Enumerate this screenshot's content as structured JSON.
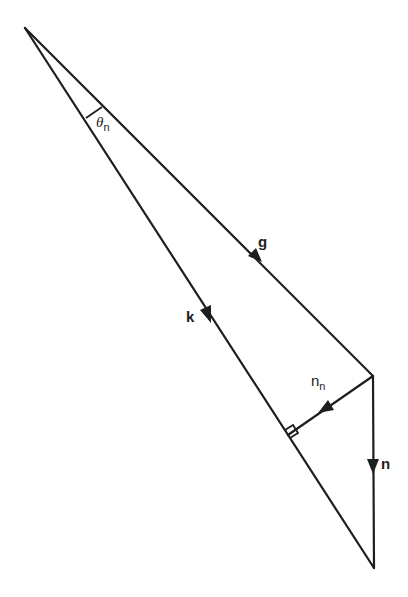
{
  "diagram": {
    "type": "vector-triangle",
    "points": {
      "apex": [
        25,
        28
      ],
      "right_corner": [
        373,
        376
      ],
      "bottom": [
        374,
        568
      ],
      "perpendicular_foot": [
        288,
        435
      ]
    },
    "vectors": [
      {
        "id": "g",
        "label": "g",
        "from": "apex",
        "to": "right_corner",
        "style": "bold"
      },
      {
        "id": "k",
        "label": "k",
        "from": "apex",
        "to": "bottom",
        "style": "bold"
      },
      {
        "id": "n",
        "label": "n",
        "from": "right_corner",
        "to": "bottom",
        "style": "bold"
      },
      {
        "id": "n_n",
        "label": "n",
        "subscript": "n",
        "from": "right_corner",
        "to": "perpendicular_foot",
        "style": "regular"
      }
    ],
    "angle": {
      "label": "θ",
      "subscript": "n",
      "at": "apex",
      "between": [
        "g",
        "k"
      ]
    },
    "right_angle_marker": {
      "at": "perpendicular_foot"
    },
    "colors": {
      "stroke": "#1e1e1e",
      "background": "#ffffff"
    }
  },
  "labels": {
    "g": "g",
    "k": "k",
    "n": "n",
    "n_n_main": "n",
    "n_n_sub": "n",
    "theta_main": "θ",
    "theta_sub": "n"
  }
}
